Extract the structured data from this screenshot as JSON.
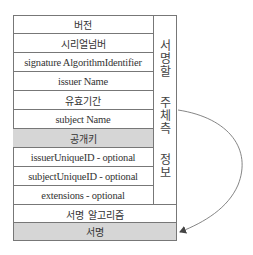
{
  "diagram": {
    "rows": [
      {
        "label": "버전",
        "shaded": false,
        "span": "inner"
      },
      {
        "label": "시리얼넘버",
        "shaded": false,
        "span": "inner"
      },
      {
        "label": "signature AlgorithmIdentifier",
        "shaded": false,
        "span": "inner"
      },
      {
        "label": "issuer Name",
        "shaded": false,
        "span": "inner"
      },
      {
        "label": "유효기간",
        "shaded": false,
        "span": "inner"
      },
      {
        "label": "subject Name",
        "shaded": false,
        "span": "inner"
      },
      {
        "label": "공개키",
        "shaded": true,
        "span": "inner"
      },
      {
        "label": "issuerUniqueID - optional",
        "shaded": false,
        "span": "inner"
      },
      {
        "label": "subjectUniqueID - optional",
        "shaded": false,
        "span": "inner"
      },
      {
        "label": "extensions - optional",
        "shaded": false,
        "span": "inner"
      },
      {
        "label": "서명 알고리즘",
        "shaded": false,
        "span": "full"
      },
      {
        "label": "서명",
        "shaded": true,
        "span": "full"
      }
    ],
    "side_label": {
      "lines": [
        "서",
        "명",
        "할",
        "",
        "주",
        "체",
        "측",
        "",
        "정",
        "보"
      ],
      "text": "서명할 주체측 정보"
    },
    "arrow": {
      "from": "side-label",
      "to": "서명",
      "style": "curved"
    },
    "colors": {
      "line": "#777777",
      "shade": "#d6d6d6",
      "text": "#333333"
    }
  }
}
